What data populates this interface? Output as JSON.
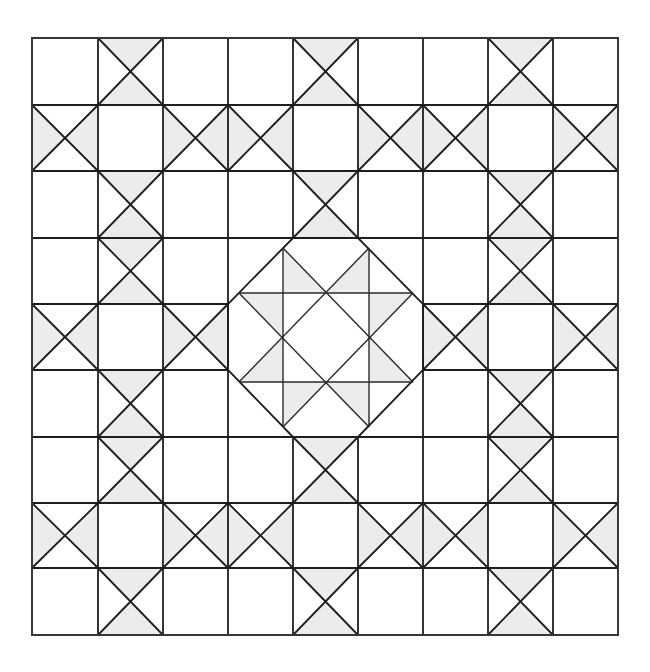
{
  "diagram": {
    "title": "",
    "type": "quilt-pattern",
    "colors": {
      "line": "#1e1e1e",
      "shade": "#ececec",
      "background": "#ffffff"
    },
    "grid": {
      "rows": 9,
      "cols": 9,
      "x_lines": [
        32,
        98,
        163,
        228,
        293,
        358,
        423,
        488,
        553,
        618
      ],
      "y_lines": [
        38,
        105,
        171,
        238,
        304,
        370,
        437,
        503,
        568,
        635
      ]
    },
    "cell_legend": {
      "P": "plain square",
      "H": "X-cell with left and right triangles shaded",
      "V": "X-cell with top and bottom triangles shaded",
      "C": "center block (drawn separately)"
    },
    "cells": [
      [
        "P",
        "V",
        "P",
        "P",
        "V",
        "P",
        "P",
        "V",
        "P"
      ],
      [
        "H",
        "P",
        "H",
        "H",
        "P",
        "H",
        "H",
        "P",
        "H"
      ],
      [
        "P",
        "V",
        "P",
        "P",
        "V",
        "P",
        "P",
        "V",
        "P"
      ],
      [
        "P",
        "V",
        "P",
        "C",
        "C",
        "C",
        "P",
        "V",
        "P"
      ],
      [
        "H",
        "P",
        "H",
        "C",
        "C",
        "C",
        "H",
        "P",
        "H"
      ],
      [
        "P",
        "V",
        "P",
        "C",
        "C",
        "C",
        "P",
        "V",
        "P"
      ],
      [
        "P",
        "V",
        "P",
        "P",
        "V",
        "P",
        "P",
        "V",
        "P"
      ],
      [
        "H",
        "P",
        "H",
        "H",
        "P",
        "H",
        "H",
        "P",
        "H"
      ],
      [
        "P",
        "V",
        "P",
        "P",
        "V",
        "P",
        "P",
        "V",
        "P"
      ]
    ],
    "center_block": {
      "bounds": [
        228,
        238,
        423,
        437
      ],
      "octagon": [
        [
          293,
          238
        ],
        [
          358,
          238
        ],
        [
          423,
          304
        ],
        [
          423,
          370
        ],
        [
          358,
          437
        ],
        [
          293,
          437
        ],
        [
          228,
          370
        ],
        [
          228,
          304
        ]
      ],
      "inner_lines": [
        [
          [
            283,
            248
          ],
          [
            283,
            427
          ]
        ],
        [
          [
            369,
            248
          ],
          [
            369,
            427
          ]
        ],
        [
          [
            239,
            293
          ],
          [
            413,
            293
          ]
        ],
        [
          [
            239,
            382
          ],
          [
            413,
            382
          ]
        ],
        [
          [
            283,
            248
          ],
          [
            413,
            382
          ]
        ],
        [
          [
            239,
            293
          ],
          [
            369,
            427
          ]
        ],
        [
          [
            369,
            248
          ],
          [
            239,
            382
          ]
        ],
        [
          [
            413,
            293
          ],
          [
            283,
            427
          ]
        ]
      ],
      "shaded_triangles": [
        [
          [
            283,
            248
          ],
          [
            326,
            293
          ],
          [
            283,
            293
          ]
        ],
        [
          [
            369,
            248
          ],
          [
            326,
            293
          ],
          [
            369,
            293
          ]
        ],
        [
          [
            239,
            293
          ],
          [
            283,
            293
          ],
          [
            283,
            337
          ]
        ],
        [
          [
            413,
            293
          ],
          [
            369,
            293
          ],
          [
            369,
            337
          ]
        ],
        [
          [
            239,
            382
          ],
          [
            283,
            382
          ],
          [
            283,
            337
          ]
        ],
        [
          [
            413,
            382
          ],
          [
            369,
            382
          ],
          [
            369,
            337
          ]
        ],
        [
          [
            283,
            427
          ],
          [
            283,
            382
          ],
          [
            326,
            382
          ]
        ],
        [
          [
            369,
            427
          ],
          [
            369,
            382
          ],
          [
            326,
            382
          ]
        ]
      ]
    }
  }
}
